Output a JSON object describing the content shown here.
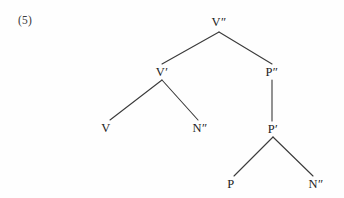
{
  "figure": {
    "example_number": "(5)",
    "background_color": "#fefefe",
    "line_color": "#3a3a3a",
    "text_color": "#222222"
  },
  "tree": {
    "type": "x-bar-syntax-tree",
    "nodes": [
      {
        "id": "root",
        "label": "V″",
        "x": 219,
        "y": 22
      },
      {
        "id": "vbar",
        "label": "V′",
        "x": 162,
        "y": 72
      },
      {
        "id": "pp",
        "label": "P″",
        "x": 272,
        "y": 72
      },
      {
        "id": "v",
        "label": "V",
        "x": 106,
        "y": 128
      },
      {
        "id": "nn1",
        "label": "N″",
        "x": 200,
        "y": 128
      },
      {
        "id": "pbar",
        "label": "P′",
        "x": 273,
        "y": 129
      },
      {
        "id": "p",
        "label": "P",
        "x": 231,
        "y": 184
      },
      {
        "id": "nn2",
        "label": "N″",
        "x": 316,
        "y": 184
      }
    ],
    "edges": [
      {
        "from": "root",
        "to": "vbar",
        "x1": 219,
        "y1": 32,
        "x2": 162,
        "y2": 64
      },
      {
        "from": "root",
        "to": "pp",
        "x1": 219,
        "y1": 32,
        "x2": 272,
        "y2": 64
      },
      {
        "from": "vbar",
        "to": "v",
        "x1": 162,
        "y1": 80,
        "x2": 110,
        "y2": 120
      },
      {
        "from": "vbar",
        "to": "nn1",
        "x1": 162,
        "y1": 80,
        "x2": 198,
        "y2": 120
      },
      {
        "from": "pp",
        "to": "pbar",
        "x1": 272,
        "y1": 80,
        "x2": 272,
        "y2": 121
      },
      {
        "from": "pbar",
        "to": "p",
        "x1": 273,
        "y1": 137,
        "x2": 234,
        "y2": 176
      },
      {
        "from": "pbar",
        "to": "nn2",
        "x1": 273,
        "y1": 137,
        "x2": 313,
        "y2": 176
      }
    ]
  }
}
